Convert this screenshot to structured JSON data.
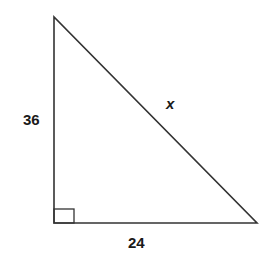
{
  "diagram": {
    "type": "right-triangle",
    "stroke_color": "#333333",
    "vertices": {
      "top": [
        54,
        17
      ],
      "right_angle": [
        54,
        223
      ],
      "bottom_right": [
        257,
        223
      ]
    },
    "right_angle_marker": {
      "x": 54,
      "y": 209,
      "size": 20
    },
    "labels": {
      "vertical_leg": "36",
      "horizontal_leg": "24",
      "hypotenuse": "x"
    }
  }
}
